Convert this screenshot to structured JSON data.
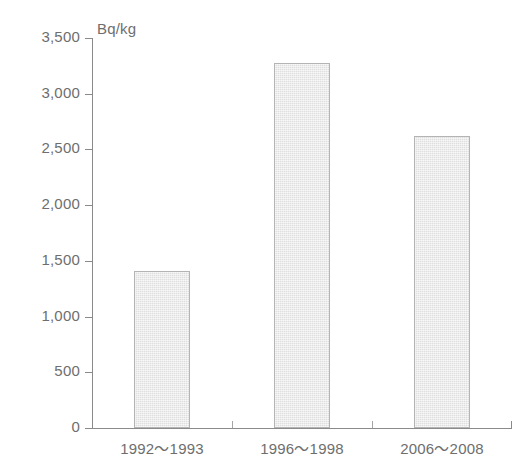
{
  "chart_data": {
    "type": "bar",
    "title": "",
    "subtitle": "",
    "xlabel": "",
    "ylabel": "",
    "unit_label": "Bq/kg",
    "categories": [
      "1992～1993",
      "1996～1998",
      "2006～2008"
    ],
    "values": [
      1410,
      3280,
      2620
    ],
    "series": [
      {
        "name": "",
        "values": [
          1410,
          3280,
          2620
        ]
      }
    ],
    "ylim": [
      0,
      3500
    ],
    "y_ticks": [
      0,
      500,
      1000,
      1500,
      2000,
      2500,
      3000,
      3500
    ],
    "y_tick_labels": [
      "0",
      "500",
      "1,000",
      "1,500",
      "2,000",
      "2,500",
      "3,000",
      "3,500"
    ],
    "grid": false,
    "legend": null,
    "legend_position": "none",
    "annotations": [],
    "colors": {
      "background": "#ffffff",
      "axis": "#8a8a8a",
      "text": "#6e6e6e",
      "bar_fill": "#dedede",
      "bar_border": "#b4b4b4"
    }
  }
}
